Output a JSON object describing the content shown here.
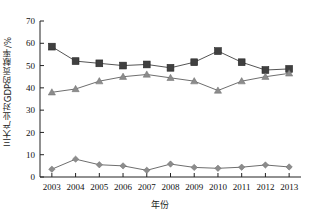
{
  "chart_data": {
    "type": "line",
    "title": "",
    "xlabel": "年份",
    "ylabel": "三大产业对GDP的贡献率/%",
    "categories": [
      "2003",
      "2004",
      "2005",
      "2006",
      "2007",
      "2008",
      "2009",
      "2010",
      "2011",
      "2012",
      "2013"
    ],
    "x": [
      2003,
      2004,
      2005,
      2006,
      2007,
      2008,
      2009,
      2010,
      2011,
      2012,
      2013
    ],
    "xlim": [
      2002.5,
      2013.5
    ],
    "ylim": [
      0,
      70
    ],
    "yticks": [
      0,
      10,
      20,
      30,
      40,
      50,
      60,
      70
    ],
    "ytick_labels": [
      "0",
      "10",
      "20",
      "30",
      "40",
      "50",
      "60",
      "70"
    ],
    "grid": false,
    "legend": "none",
    "series": [
      {
        "name": "第二产业",
        "marker": "square",
        "color": "#404040",
        "line_color": "#555555",
        "values": [
          58.5,
          52.0,
          51.0,
          50.0,
          50.5,
          49.0,
          51.5,
          56.5,
          51.5,
          48.0,
          48.5
        ]
      },
      {
        "name": "第三产业",
        "marker": "triangle",
        "color": "#8c8c8c",
        "line_color": "#6e6e6e",
        "values": [
          38.0,
          39.5,
          43.0,
          45.0,
          46.0,
          44.5,
          43.0,
          38.8,
          43.0,
          45.0,
          46.5
        ]
      },
      {
        "name": "第一产业",
        "marker": "diamond",
        "color": "#8c8c8c",
        "line_color": "#6e6e6e",
        "values": [
          3.5,
          8.0,
          5.5,
          5.0,
          3.0,
          5.8,
          4.3,
          3.9,
          4.4,
          5.4,
          4.5
        ]
      }
    ]
  },
  "axis": {
    "y_axis_label": "三大产业对GDP的贡献率/%",
    "x_axis_label": "年份"
  }
}
